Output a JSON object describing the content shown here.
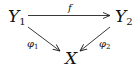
{
  "diagram": {
    "type": "commutative-triangle",
    "nodes": [
      {
        "id": "Y1",
        "base": "Y",
        "sub": "1"
      },
      {
        "id": "Y2",
        "base": "Y",
        "sub": "2"
      },
      {
        "id": "X",
        "base": "X",
        "sub": ""
      }
    ],
    "edges": [
      {
        "from": "Y1",
        "to": "Y2",
        "label_base": "f",
        "label_sub": ""
      },
      {
        "from": "Y1",
        "to": "X",
        "label_base": "φ",
        "label_sub": "1"
      },
      {
        "from": "Y2",
        "to": "X",
        "label_base": "φ",
        "label_sub": "2"
      }
    ]
  }
}
